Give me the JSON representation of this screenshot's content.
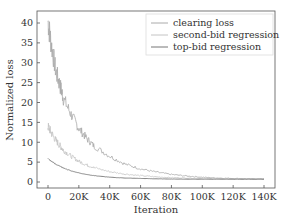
{
  "chart_data": {
    "type": "line",
    "title": "",
    "xlabel": "Iteration",
    "ylabel": "Normalized loss",
    "xlim": [
      -5000,
      147000
    ],
    "ylim": [
      -2,
      43
    ],
    "grid": false,
    "legend_position": "upper right",
    "x_ticks": [
      0,
      20000,
      40000,
      60000,
      80000,
      100000,
      120000,
      140000
    ],
    "x_tick_labels": [
      "0",
      "20K",
      "40K",
      "60K",
      "80K",
      "100K",
      "120K",
      "140K"
    ],
    "y_ticks": [
      0,
      5,
      10,
      15,
      20,
      25,
      30,
      35,
      40
    ],
    "y_tick_labels": [
      "0",
      "5",
      "10",
      "15",
      "20",
      "25",
      "30",
      "35",
      "40"
    ],
    "x": [
      0,
      2000,
      5000,
      8000,
      10000,
      15000,
      20000,
      25000,
      30000,
      40000,
      50000,
      60000,
      70000,
      80000,
      90000,
      100000,
      110000,
      120000,
      130000,
      140000
    ],
    "series": [
      {
        "name": "clearing loss",
        "color": "#aaaaaa",
        "values": [
          40.5,
          35,
          28,
          24,
          21,
          17,
          13.5,
          11,
          9,
          6.5,
          4.5,
          3.3,
          2.5,
          1.9,
          1.5,
          1.2,
          1.0,
          0.9,
          0.8,
          0.8
        ]
      },
      {
        "name": "second-bid regression",
        "color": "#c4c4c4",
        "values": [
          14,
          12.5,
          10.5,
          9,
          8,
          6.5,
          5.2,
          4.3,
          3.6,
          2.6,
          2.0,
          1.6,
          1.3,
          1.1,
          1.0,
          0.9,
          0.85,
          0.8,
          0.8,
          0.8
        ]
      },
      {
        "name": "top-bid regression",
        "color": "#777777",
        "values": [
          6,
          5.3,
          4.5,
          3.9,
          3.5,
          2.8,
          2.3,
          1.9,
          1.6,
          1.2,
          1.0,
          0.9,
          0.8,
          0.75,
          0.7,
          0.7,
          0.7,
          0.7,
          0.7,
          0.7
        ]
      }
    ]
  }
}
